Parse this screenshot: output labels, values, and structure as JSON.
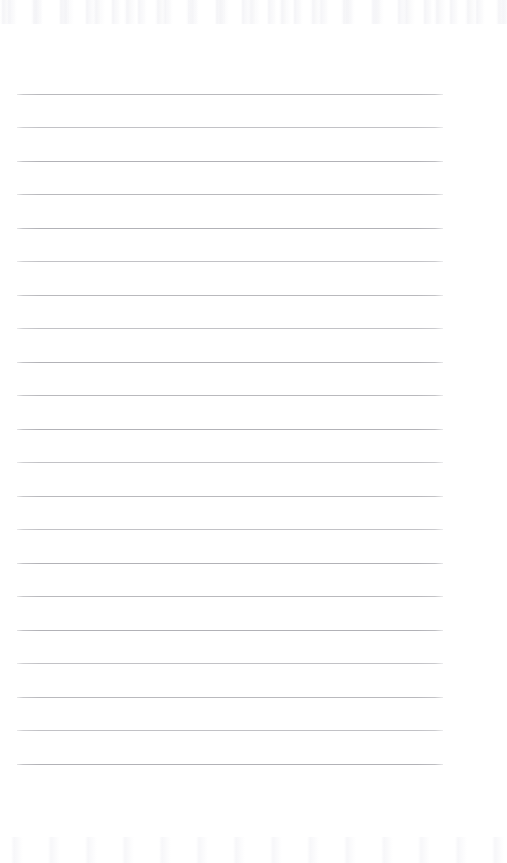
{
  "page": {
    "kind": "blank-ruled-paper",
    "width_px": 507,
    "height_px": 863,
    "background_color": "#ffffff",
    "written_content": "",
    "written_content_note": "No handwriting, no printed text, no headings, no page number are visible on this page."
  },
  "ruling": {
    "line_color": "#b9b9bd",
    "line_color_variants": [
      "#b9b9bd",
      "#c2c2c6",
      "#b2b2b7"
    ],
    "line_thickness_px": 1,
    "line_count": 21,
    "first_line_y": 94,
    "last_line_y": 764,
    "line_spacing_px": 33.5,
    "line_start_x": 17,
    "line_end_x": 443,
    "line_length_px": 426,
    "left_margin_px": 17,
    "right_margin_px": 64,
    "top_margin_px": 94,
    "bottom_margin_px": 99,
    "lines_y": [
      94,
      127,
      161,
      194,
      228,
      261,
      295,
      328,
      362,
      395,
      429,
      462,
      496,
      529,
      563,
      596,
      630,
      663,
      697,
      730,
      764
    ]
  },
  "artifacts": {
    "top_noise_band": {
      "label": "faint scanner noise",
      "y_start": 0,
      "y_end": 24,
      "color": "#f6f6f8"
    },
    "bottom_noise_band": {
      "label": "faint scanner noise",
      "y_start": 838,
      "y_end": 863,
      "color": "#f8f8fa"
    }
  }
}
